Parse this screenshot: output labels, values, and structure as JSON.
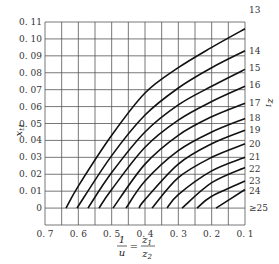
{
  "chart_data": {
    "type": "line",
    "title": "",
    "xlabel": "1/u = z1/z2",
    "ylabel": "x_t1",
    "right_label": "z1",
    "xlim": [
      0.7,
      0.1
    ],
    "ylim": [
      -0.01,
      0.11
    ],
    "x_reversed": true,
    "grid": true,
    "legend_position": "right-edge labels",
    "x_ticks": [
      "0.7",
      "0.6",
      "0.5",
      "0.4",
      "0.3",
      "0.2",
      "0.1"
    ],
    "y_ticks": [
      "0",
      "0.01",
      "0.02",
      "0.03",
      "0.04",
      "0.05",
      "0.06",
      "0.07",
      "0.08",
      "0.09",
      "0.10",
      "0.11"
    ],
    "series": [
      {
        "name": "13",
        "points": [
          [
            0.637,
            0.0
          ],
          [
            0.6,
            0.013
          ],
          [
            0.5,
            0.043
          ],
          [
            0.4,
            0.068
          ],
          [
            0.3,
            0.083
          ],
          [
            0.2,
            0.095
          ],
          [
            0.1,
            0.106
          ]
        ]
      },
      {
        "name": "14",
        "points": [
          [
            0.604,
            0.0
          ],
          [
            0.5,
            0.031
          ],
          [
            0.4,
            0.055
          ],
          [
            0.3,
            0.071
          ],
          [
            0.2,
            0.083
          ],
          [
            0.1,
            0.093
          ]
        ]
      },
      {
        "name": "15",
        "points": [
          [
            0.571,
            0.0
          ],
          [
            0.5,
            0.021
          ],
          [
            0.4,
            0.045
          ],
          [
            0.3,
            0.061
          ],
          [
            0.2,
            0.072
          ],
          [
            0.1,
            0.082
          ]
        ]
      },
      {
        "name": "16",
        "points": [
          [
            0.538,
            0.0
          ],
          [
            0.5,
            0.011
          ],
          [
            0.4,
            0.036
          ],
          [
            0.3,
            0.052
          ],
          [
            0.2,
            0.063
          ],
          [
            0.1,
            0.072
          ]
        ]
      },
      {
        "name": "17",
        "points": [
          [
            0.496,
            0.0
          ],
          [
            0.4,
            0.026
          ],
          [
            0.3,
            0.043
          ],
          [
            0.2,
            0.054
          ],
          [
            0.1,
            0.062
          ]
        ]
      },
      {
        "name": "18",
        "points": [
          [
            0.457,
            0.0
          ],
          [
            0.4,
            0.016
          ],
          [
            0.3,
            0.034
          ],
          [
            0.2,
            0.045
          ],
          [
            0.1,
            0.053
          ]
        ]
      },
      {
        "name": "19",
        "points": [
          [
            0.418,
            0.0
          ],
          [
            0.4,
            0.005
          ],
          [
            0.3,
            0.026
          ],
          [
            0.2,
            0.038
          ],
          [
            0.1,
            0.046
          ]
        ]
      },
      {
        "name": "20",
        "points": [
          [
            0.379,
            0.0
          ],
          [
            0.3,
            0.018
          ],
          [
            0.2,
            0.03
          ],
          [
            0.1,
            0.038
          ]
        ]
      },
      {
        "name": "21",
        "points": [
          [
            0.334,
            0.0
          ],
          [
            0.3,
            0.008
          ],
          [
            0.2,
            0.022
          ],
          [
            0.1,
            0.03
          ]
        ]
      },
      {
        "name": "22",
        "points": [
          [
            0.289,
            0.0
          ],
          [
            0.2,
            0.015
          ],
          [
            0.1,
            0.024
          ]
        ]
      },
      {
        "name": "23",
        "points": [
          [
            0.244,
            0.0
          ],
          [
            0.2,
            0.007
          ],
          [
            0.1,
            0.016
          ]
        ]
      },
      {
        "name": "24",
        "points": [
          [
            0.187,
            0.0
          ],
          [
            0.1,
            0.011
          ]
        ]
      }
    ],
    "right_labels": [
      {
        "text": "13",
        "y": 0.117
      },
      {
        "text": "14",
        "y": 0.093
      },
      {
        "text": "15",
        "y": 0.083
      },
      {
        "text": "16",
        "y": 0.073
      },
      {
        "text": "17",
        "y": 0.062
      },
      {
        "text": "18",
        "y": 0.053
      },
      {
        "text": "19",
        "y": 0.046
      },
      {
        "text": "20",
        "y": 0.038
      },
      {
        "text": "21",
        "y": 0.03
      },
      {
        "text": "22",
        "y": 0.023
      },
      {
        "text": "23",
        "y": 0.016
      },
      {
        "text": "24",
        "y": 0.01
      },
      {
        "text": "≥25",
        "y": 0.0
      }
    ]
  }
}
